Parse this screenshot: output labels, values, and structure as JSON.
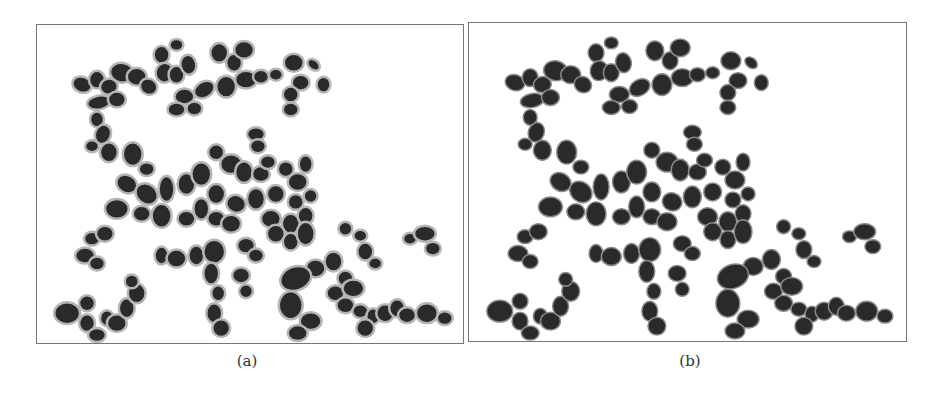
{
  "figure": {
    "panels": [
      {
        "id": "a",
        "caption": "(a)",
        "description": "Segmented cell clusters with gray contour outlines (watershed-style boundaries)"
      },
      {
        "id": "b",
        "caption": "(b)",
        "description": "Segmented cell clusters with fitted ellipse outlines"
      }
    ]
  },
  "colors": {
    "cell_fill": "#2a2a2a",
    "outline_a": "#b5b5b5",
    "outline_b": "#8a8a8a",
    "border": "#777777",
    "background": "#ffffff"
  }
}
